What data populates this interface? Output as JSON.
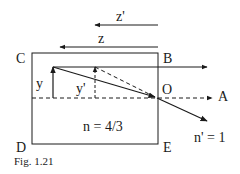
{
  "figure": {
    "caption": "Fig. 1.21",
    "labels": {
      "z_prime": "z'",
      "z": "z",
      "C": "C",
      "B": "B",
      "D": "D",
      "E": "E",
      "O": "O",
      "A": "A",
      "y": "y",
      "y_prime": "y'",
      "n_inside": "n = 4/3",
      "n_outside": "n' = 1"
    },
    "colors": {
      "line": "#1a1a1a",
      "background": "#ffffff"
    }
  }
}
